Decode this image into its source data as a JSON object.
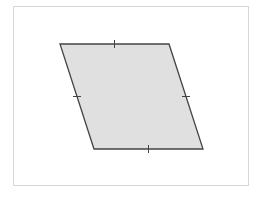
{
  "diagram": {
    "shape": "parallelogram",
    "fill_color": "#e0e0e0",
    "stroke_color": "#444444",
    "frame_color": "#d6d6d6",
    "tick_marks_per_side": 1,
    "sides": [
      "top",
      "right",
      "bottom",
      "left"
    ]
  }
}
